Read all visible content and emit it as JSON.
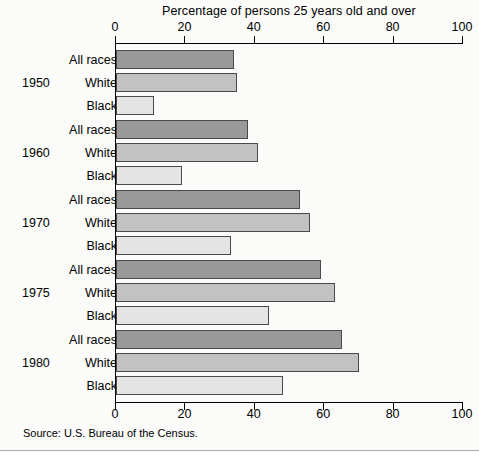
{
  "chart_data": {
    "type": "bar",
    "orientation": "horizontal",
    "title": "Percentage of persons 25 years old and over",
    "xlabel": "",
    "ylabel": "",
    "xlim": [
      0,
      100
    ],
    "xticks": [
      0,
      20,
      40,
      60,
      80,
      100
    ],
    "xtick_labels": [
      "0",
      "20",
      "40",
      "60",
      "80",
      "100"
    ],
    "grid": false,
    "legend": "none",
    "categories": [
      "1950",
      "1960",
      "1970",
      "1975",
      "1980"
    ],
    "series": [
      {
        "name": "All races",
        "color": "#999999",
        "values": [
          34,
          38,
          53,
          59,
          65
        ]
      },
      {
        "name": "White",
        "color": "#c2c2c2",
        "values": [
          35,
          41,
          56,
          63,
          70
        ]
      },
      {
        "name": "Black",
        "color": "#e4e4e4",
        "values": [
          11,
          19,
          33,
          44,
          48
        ]
      }
    ],
    "groups": [
      {
        "year": "1950",
        "bars": [
          {
            "label": "All races",
            "value": 34,
            "style": "all-races"
          },
          {
            "label": "White",
            "value": 35,
            "style": "white"
          },
          {
            "label": "Black",
            "value": 11,
            "style": "black"
          }
        ]
      },
      {
        "year": "1960",
        "bars": [
          {
            "label": "All races",
            "value": 38,
            "style": "all-races"
          },
          {
            "label": "White",
            "value": 41,
            "style": "white"
          },
          {
            "label": "Black",
            "value": 19,
            "style": "black"
          }
        ]
      },
      {
        "year": "1970",
        "bars": [
          {
            "label": "All races",
            "value": 53,
            "style": "all-races"
          },
          {
            "label": "White",
            "value": 56,
            "style": "white"
          },
          {
            "label": "Black",
            "value": 33,
            "style": "black"
          }
        ]
      },
      {
        "year": "1975",
        "bars": [
          {
            "label": "All races",
            "value": 59,
            "style": "all-races"
          },
          {
            "label": "White",
            "value": 63,
            "style": "white"
          },
          {
            "label": "Black",
            "value": 44,
            "style": "black"
          }
        ]
      },
      {
        "year": "1980",
        "bars": [
          {
            "label": "All races",
            "value": 65,
            "style": "all-races"
          },
          {
            "label": "White",
            "value": 70,
            "style": "white"
          },
          {
            "label": "Black",
            "value": 48,
            "style": "black"
          }
        ]
      }
    ]
  },
  "source_note": "Source: U.S. Bureau of the Census.",
  "colors": {
    "all_races": "#999999",
    "white": "#c2c2c2",
    "black": "#e4e4e4",
    "axis": "#000000",
    "background": "#fbfbfa"
  }
}
